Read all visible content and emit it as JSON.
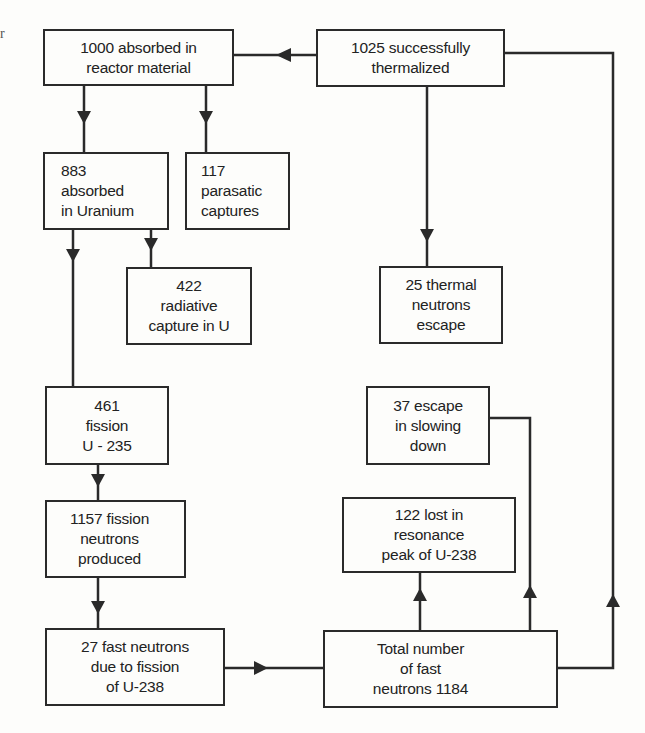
{
  "diagram": {
    "type": "flowchart",
    "edge_text": "r",
    "nodes": [
      {
        "id": "absorbed_reactor",
        "lines": [
          "1000 absorbed in",
          "reactor material"
        ]
      },
      {
        "id": "thermalized",
        "lines": [
          "1025 successfully",
          "thermalized"
        ]
      },
      {
        "id": "absorbed_uranium",
        "lines": [
          "883",
          "absorbed",
          "in Uranium"
        ]
      },
      {
        "id": "parasitic",
        "lines": [
          "117",
          "parasatic",
          "captures"
        ]
      },
      {
        "id": "radiative",
        "lines": [
          "422",
          "radiative",
          "capture in U"
        ]
      },
      {
        "id": "thermal_escape",
        "lines": [
          "25 thermal",
          "neutrons",
          "escape"
        ]
      },
      {
        "id": "fission_u235",
        "lines": [
          "461",
          "fission",
          "U - 235"
        ]
      },
      {
        "id": "slowing_escape",
        "lines": [
          "37 escape",
          "in slowing",
          "down"
        ]
      },
      {
        "id": "fission_neutrons",
        "lines": [
          "1157 fission",
          "neutrons",
          "produced"
        ]
      },
      {
        "id": "resonance_loss",
        "lines": [
          "122 lost in",
          "resonance",
          "peak of U-238"
        ]
      },
      {
        "id": "fast_u238",
        "lines": [
          "27 fast neutrons",
          "due to fission",
          "of U-238"
        ]
      },
      {
        "id": "total_fast",
        "lines": [
          "Total number",
          "of fast",
          "neutrons 1184"
        ]
      }
    ],
    "edges": [
      {
        "from": "thermalized",
        "to": "absorbed_reactor"
      },
      {
        "from": "thermalized",
        "to": "thermal_escape"
      },
      {
        "from": "absorbed_reactor",
        "to": "absorbed_uranium"
      },
      {
        "from": "absorbed_reactor",
        "to": "parasitic"
      },
      {
        "from": "absorbed_uranium",
        "to": "fission_u235"
      },
      {
        "from": "absorbed_uranium",
        "to": "radiative"
      },
      {
        "from": "fission_u235",
        "to": "fission_neutrons"
      },
      {
        "from": "fission_neutrons",
        "to": "fast_u238"
      },
      {
        "from": "fast_u238",
        "to": "total_fast"
      },
      {
        "from": "total_fast",
        "to": "resonance_loss"
      },
      {
        "from": "total_fast",
        "to": "slowing_escape"
      },
      {
        "from": "total_fast",
        "to": "thermalized"
      }
    ],
    "colors": {
      "line": "#2a2a2a",
      "background": "#fdfdfb",
      "text": "#222222"
    }
  }
}
